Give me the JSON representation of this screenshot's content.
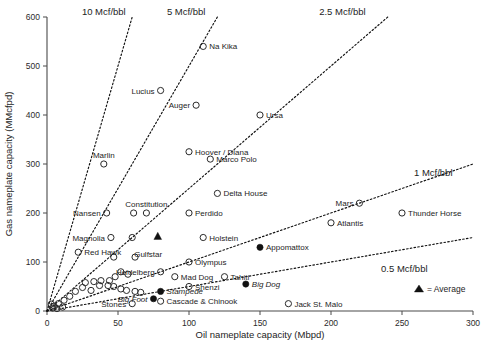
{
  "chart_data": {
    "type": "scatter",
    "title": "",
    "xlabel": "Oil nameplate capacity (Mbpd)",
    "ylabel": "Gas nameplate capacity (MMcfpd)",
    "xlim": [
      0,
      300
    ],
    "ylim": [
      0,
      600
    ],
    "xticks": [
      0,
      50,
      100,
      150,
      200,
      250,
      300
    ],
    "yticks": [
      0,
      100,
      200,
      300,
      400,
      500,
      600
    ],
    "grid": false,
    "legend": {
      "position": "bottom-right",
      "entries": [
        {
          "marker": "triangle-filled",
          "label": "= Average"
        }
      ]
    },
    "reference_lines": [
      {
        "label": "10 Mcf/bbl",
        "slope": 10,
        "label_x": 40,
        "label_y": 600
      },
      {
        "label": "5 Mcf/bbl",
        "slope": 5,
        "label_x": 98,
        "label_y": 600
      },
      {
        "label": "2.5 Mcf/bbl",
        "slope": 2.5,
        "label_x": 208,
        "label_y": 600
      },
      {
        "label": "1 Mcf/bbl",
        "slope": 1,
        "label_x": 272,
        "label_y": 300
      },
      {
        "label": "0.5 Mcf/bbl",
        "slope": 0.5,
        "label_x": 268,
        "label_y": 105
      }
    ],
    "points": [
      {
        "name": "Na Kika",
        "x": 110,
        "y": 540,
        "marker": "open",
        "label_side": "right"
      },
      {
        "name": "Lucius",
        "x": 80,
        "y": 450,
        "marker": "open",
        "label_side": "left"
      },
      {
        "name": "Auger",
        "x": 105,
        "y": 420,
        "marker": "open",
        "label_side": "left"
      },
      {
        "name": "Ursa",
        "x": 150,
        "y": 400,
        "marker": "open",
        "label_side": "right"
      },
      {
        "name": "Hoover / Diana",
        "x": 100,
        "y": 325,
        "marker": "open",
        "label_side": "right"
      },
      {
        "name": "Marco Polo",
        "x": 115,
        "y": 310,
        "marker": "open",
        "label_side": "right"
      },
      {
        "name": "Marlin",
        "x": 40,
        "y": 300,
        "marker": "open",
        "label_side": "above"
      },
      {
        "name": "Delta House",
        "x": 120,
        "y": 240,
        "marker": "open",
        "label_side": "right"
      },
      {
        "name": "Constitution",
        "x": 70,
        "y": 200,
        "marker": "open",
        "label_side": "above"
      },
      {
        "name": "Perdido",
        "x": 100,
        "y": 200,
        "marker": "open",
        "label_side": "right"
      },
      {
        "name": "Nansen",
        "x": 42,
        "y": 200,
        "marker": "open",
        "label_side": "left"
      },
      {
        "name": "Mars",
        "x": 220,
        "y": 220,
        "marker": "open",
        "label_side": "left"
      },
      {
        "name": "Thunder Horse",
        "x": 250,
        "y": 200,
        "marker": "open",
        "label_side": "right"
      },
      {
        "name": "Atlantis",
        "x": 200,
        "y": 180,
        "marker": "open",
        "label_side": "right"
      },
      {
        "name": "Holstein",
        "x": 110,
        "y": 150,
        "marker": "open",
        "label_side": "right"
      },
      {
        "name": "Magnolia",
        "x": 45,
        "y": 150,
        "marker": "open",
        "label_side": "left"
      },
      {
        "name": "Red Hawk",
        "x": 22,
        "y": 120,
        "marker": "open",
        "label_side": "right"
      },
      {
        "name": "Gulfstar",
        "x": 60,
        "y": 150,
        "marker": "open",
        "label_side": "none"
      },
      {
        "name": "Appomattox",
        "x": 150,
        "y": 130,
        "marker": "filled",
        "label_side": "right"
      },
      {
        "name": "Olympus",
        "x": 100,
        "y": 100,
        "marker": "open",
        "label_side": "right"
      },
      {
        "name": "Heidelberg",
        "x": 80,
        "y": 80,
        "marker": "open",
        "label_side": "left"
      },
      {
        "name": "Mad Dog",
        "x": 90,
        "y": 70,
        "marker": "open",
        "label_side": "right"
      },
      {
        "name": "Tahiti",
        "x": 125,
        "y": 70,
        "marker": "open",
        "label_side": "right"
      },
      {
        "name": "Big Dog",
        "x": 140,
        "y": 55,
        "marker": "filled",
        "label_side": "right"
      },
      {
        "name": "Shenzi",
        "x": 100,
        "y": 50,
        "marker": "open",
        "label_side": "right"
      },
      {
        "name": "Stampede",
        "x": 80,
        "y": 40,
        "marker": "filled",
        "label_side": "right"
      },
      {
        "name": "Cascade & Chinook",
        "x": 80,
        "y": 20,
        "marker": "open",
        "label_side": "right"
      },
      {
        "name": "Jack St. Malo",
        "x": 170,
        "y": 15,
        "marker": "open",
        "label_side": "right"
      },
      {
        "name": "Big Foot",
        "x": 75,
        "y": 25,
        "marker": "filled",
        "label_side": "left"
      },
      {
        "name": "Stones",
        "x": 60,
        "y": 15,
        "marker": "open",
        "label_side": "left"
      },
      {
        "name": "Average",
        "x": 78,
        "y": 152,
        "marker": "triangle",
        "label_side": "none"
      },
      {
        "name": "",
        "x": 62,
        "y": 110,
        "marker": "open",
        "label_side": "none"
      },
      {
        "name": "",
        "x": 61,
        "y": 200,
        "marker": "open",
        "label_side": "none"
      },
      {
        "name": "",
        "x": 47,
        "y": 110,
        "marker": "open",
        "label_side": "none"
      },
      {
        "name": "",
        "x": 52,
        "y": 80,
        "marker": "open",
        "label_side": "none"
      },
      {
        "name": "",
        "x": 57,
        "y": 75,
        "marker": "open",
        "label_side": "none"
      },
      {
        "name": "",
        "x": 48,
        "y": 70,
        "marker": "open",
        "label_side": "none"
      },
      {
        "name": "",
        "x": 44,
        "y": 62,
        "marker": "open",
        "label_side": "none"
      },
      {
        "name": "",
        "x": 43,
        "y": 52,
        "marker": "open",
        "label_side": "none"
      },
      {
        "name": "",
        "x": 47,
        "y": 50,
        "marker": "open",
        "label_side": "none"
      },
      {
        "name": "",
        "x": 38,
        "y": 62,
        "marker": "open",
        "label_side": "none"
      },
      {
        "name": "",
        "x": 37,
        "y": 52,
        "marker": "open",
        "label_side": "none"
      },
      {
        "name": "",
        "x": 33,
        "y": 60,
        "marker": "open",
        "label_side": "none"
      },
      {
        "name": "",
        "x": 31,
        "y": 42,
        "marker": "open",
        "label_side": "none"
      },
      {
        "name": "",
        "x": 27,
        "y": 58,
        "marker": "open",
        "label_side": "none"
      },
      {
        "name": "",
        "x": 25,
        "y": 48,
        "marker": "open",
        "label_side": "none"
      },
      {
        "name": "",
        "x": 52,
        "y": 45,
        "marker": "open",
        "label_side": "none"
      },
      {
        "name": "",
        "x": 56,
        "y": 42,
        "marker": "open",
        "label_side": "none"
      },
      {
        "name": "",
        "x": 62,
        "y": 40,
        "marker": "open",
        "label_side": "none"
      },
      {
        "name": "",
        "x": 66,
        "y": 38,
        "marker": "open",
        "label_side": "none"
      },
      {
        "name": "",
        "x": 20,
        "y": 40,
        "marker": "open",
        "label_side": "none"
      },
      {
        "name": "",
        "x": 16,
        "y": 30,
        "marker": "open",
        "label_side": "none"
      },
      {
        "name": "",
        "x": 12,
        "y": 22,
        "marker": "open",
        "label_side": "none"
      },
      {
        "name": "",
        "x": 8,
        "y": 15,
        "marker": "open",
        "label_side": "none"
      },
      {
        "name": "",
        "x": 5,
        "y": 10,
        "marker": "open",
        "label_side": "none"
      },
      {
        "name": "",
        "x": 4,
        "y": 6,
        "marker": "open",
        "label_side": "none"
      },
      {
        "name": "",
        "x": 7,
        "y": 5,
        "marker": "open",
        "label_side": "none"
      },
      {
        "name": "",
        "x": 11,
        "y": 8,
        "marker": "open",
        "label_side": "none"
      },
      {
        "name": "",
        "x": 3,
        "y": 14,
        "marker": "open",
        "label_side": "none"
      }
    ]
  },
  "axes": {
    "x_title": "Oil nameplate capacity (Mbpd)",
    "y_title": "Gas nameplate capacity (MMcfpd)",
    "x_tick_labels": [
      "0",
      "50",
      "100",
      "150",
      "200",
      "250",
      "300"
    ],
    "y_tick_labels": [
      "0",
      "100",
      "200",
      "300",
      "400",
      "500",
      "600"
    ]
  },
  "ratio_labels": {
    "r10": "10 Mcf/bbl",
    "r5": "5 Mcf/bbl",
    "r25": "2.5 Mcf/bbl",
    "r1": "1 Mcf/bbl",
    "r05": "0.5 Mcf/bbl"
  },
  "legend": {
    "average_text": "= Average"
  },
  "point_labels": {
    "na_kika": "Na Kika",
    "lucius": "Lucius",
    "auger": "Auger",
    "ursa": "Ursa",
    "hoover_diana": "Hoover / Diana",
    "marco_polo": "Marco Polo",
    "marlin": "Marlin",
    "delta_house": "Delta House",
    "constitution": "Constitution",
    "perdido": "Perdido",
    "nansen": "Nansen",
    "mars": "Mars",
    "thunder_horse": "Thunder Horse",
    "atlantis": "Atlantis",
    "holstein": "Holstein",
    "magnolia": "Magnolia",
    "red_hawk": "Red Hawk",
    "gulfstar": "Gulfstar",
    "appomattox": "Appomattox",
    "olympus": "Olympus",
    "heidelberg": "Heidelberg",
    "mad_dog": "Mad Dog",
    "tahiti": "Tahiti",
    "big_dog": "Big Dog",
    "shenzi": "Shenzi",
    "stampede": "Stampede",
    "cascade_chinook": "Cascade & Chinook",
    "jack_st_malo": "Jack St. Malo",
    "big_foot": "Big Foot",
    "stones": "Stones"
  },
  "colors": {
    "marker_stroke": "#2a2a2a",
    "axis": "#4a4a4a",
    "text": "#1d1d1d",
    "ratio_line": "#111111",
    "background": "#ffffff"
  }
}
